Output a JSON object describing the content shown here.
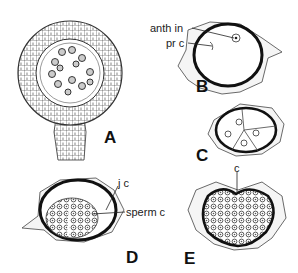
{
  "figure": {
    "panels": [
      {
        "id": "A",
        "label": "A"
      },
      {
        "id": "B",
        "label": "B",
        "annotations": [
          "anth in",
          "pr c"
        ]
      },
      {
        "id": "C",
        "label": "C"
      },
      {
        "id": "D",
        "label": "D",
        "annotations": [
          "j c",
          "sperm c"
        ]
      },
      {
        "id": "E",
        "label": "E",
        "annotations": [
          "c"
        ]
      }
    ]
  }
}
